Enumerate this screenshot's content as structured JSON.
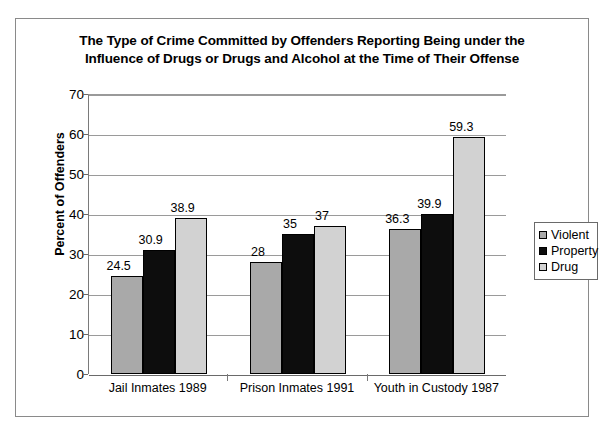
{
  "chart_data": {
    "type": "bar",
    "title": "The Type of Crime Committed by Offenders Reporting Being under the Influence of Drugs or Drugs and Alcohol at the Time of Their Offense",
    "title_line1": "The Type of Crime Committed by Offenders Reporting Being under the",
    "title_line2": "Influence of Drugs or Drugs and Alcohol at the Time of Their Offense",
    "xlabel": "",
    "ylabel": "Percent of Offenders",
    "ylim": [
      0,
      70
    ],
    "ytick_step": 10,
    "yticks": [
      "0",
      "10",
      "20",
      "30",
      "40",
      "50",
      "60",
      "70"
    ],
    "grid": true,
    "legend_position": "right",
    "categories": [
      "Jail Inmates 1989",
      "Prison Inmates 1991",
      "Youth in Custody 1987"
    ],
    "series": [
      {
        "name": "Violent",
        "color": "#a9a9a9",
        "values": [
          24.5,
          28,
          36.3
        ],
        "labels": [
          "24.5",
          "28",
          "36.3"
        ]
      },
      {
        "name": "Property",
        "color": "#0d0d0d",
        "values": [
          30.9,
          35,
          39.9
        ],
        "labels": [
          "30.9",
          "35",
          "39.9"
        ]
      },
      {
        "name": "Drug",
        "color": "#d2d2d2",
        "values": [
          38.9,
          37,
          59.3
        ],
        "labels": [
          "38.9",
          "37",
          "59.3"
        ]
      }
    ]
  },
  "colors": {
    "violent": "#a9a9a9",
    "property": "#0d0d0d",
    "drug": "#d2d2d2",
    "frame": "#8a8a8a",
    "gridline": "#9a9a9a",
    "axis": "#6a6a6a",
    "background": "#ffffff",
    "text": "#000000"
  }
}
